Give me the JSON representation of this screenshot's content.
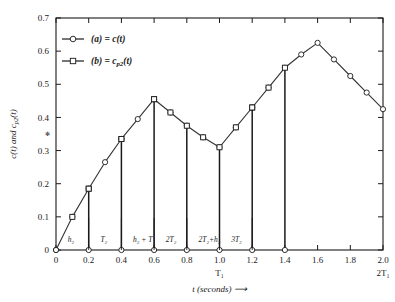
{
  "chart_data": {
    "type": "line",
    "title": "",
    "xlabel": "t (seconds)",
    "ylabel": "c(t) and c_p2(t)",
    "xlim": [
      0,
      2.0
    ],
    "ylim": [
      0,
      0.7
    ],
    "grid": false,
    "legend_position": "top-left",
    "x_ticks": [
      "0",
      "0.2",
      "0.4",
      "0.6",
      "0.8",
      "1.0",
      "1.2",
      "1.4",
      "1.6",
      "1.8",
      "2.0"
    ],
    "x_tick_values": [
      0,
      0.2,
      0.4,
      0.6,
      0.8,
      1.0,
      1.2,
      1.4,
      1.6,
      1.8,
      2.0
    ],
    "y_ticks": [
      "0",
      "0.1",
      "0.2",
      "0.3",
      "0.4",
      "0.5",
      "0.6",
      "0.7"
    ],
    "y_tick_values": [
      0,
      0.1,
      0.2,
      0.3,
      0.4,
      0.5,
      0.6,
      0.7
    ],
    "x_secondary_labels": [
      {
        "value": 1.0,
        "text": "T₁"
      },
      {
        "value": 2.0,
        "text": "2T₁"
      }
    ],
    "annotations": [
      {
        "text": "h₂",
        "x": 0.2
      },
      {
        "text": "T₂",
        "x": 0.4
      },
      {
        "text": "h₂ + T",
        "x": 0.6
      },
      {
        "text": "2T₂",
        "x": 0.8
      },
      {
        "text": "2T₂+h₂",
        "x": 1.0
      },
      {
        "text": "3T₂",
        "x": 1.2
      }
    ],
    "series": [
      {
        "name": "(a) = c(t)",
        "marker": "circle",
        "x": [
          0,
          0.1,
          0.2,
          0.3,
          0.4,
          0.5,
          0.6,
          0.7,
          0.8,
          0.9,
          1.0,
          1.1,
          1.2,
          1.3,
          1.4,
          1.5,
          1.6,
          1.7,
          1.8,
          1.9,
          2.0
        ],
        "values": [
          0,
          0.1,
          0.185,
          0.265,
          0.335,
          0.395,
          0.455,
          0.415,
          0.375,
          0.34,
          0.31,
          0.37,
          0.43,
          0.49,
          0.55,
          0.59,
          0.625,
          0.575,
          0.525,
          0.475,
          0.425
        ]
      },
      {
        "name": "(b) = c_p2(t)",
        "marker": "square",
        "x": [
          0.1,
          0.2,
          0.4,
          0.6,
          0.7,
          0.9,
          1.1,
          1.2,
          1.3
        ],
        "values": [
          0.1,
          0.185,
          0.335,
          0.455,
          0.415,
          0.34,
          0.37,
          0.43,
          0.49
        ],
        "impulse_x": [
          0,
          0.2,
          0.4,
          0.6,
          0.8,
          1.0,
          1.2,
          1.4
        ],
        "impulse_values": [
          0,
          0.185,
          0.335,
          0.455,
          0.375,
          0.31,
          0.43,
          0.55
        ]
      }
    ]
  },
  "legend": {
    "entries": [
      {
        "label": "(a) = c(t)",
        "marker": "circle"
      },
      {
        "label": "(b) = c_p2(t)",
        "marker": "square"
      }
    ]
  }
}
